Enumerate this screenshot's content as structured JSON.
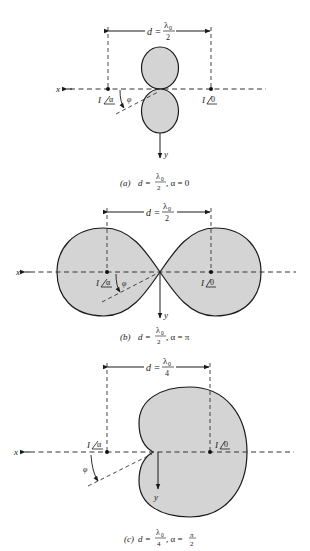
{
  "figure": {
    "colors": {
      "lobe_fill": "#d4d4d4",
      "stroke": "#1a1a1a",
      "background": "#ffffff"
    },
    "axis_labels": {
      "x": "x",
      "y": "y",
      "angle": "φ"
    },
    "panels": [
      {
        "id": "a",
        "dimension": {
          "prefix": "d =",
          "num": "λ",
          "sub": "0",
          "den": "2"
        },
        "left_source": {
          "current": "I",
          "phase": "α"
        },
        "right_source": {
          "current": "I",
          "phase": "0"
        },
        "caption": {
          "tag": "(a)",
          "prefix": "d =",
          "num": "λ",
          "sub": "0",
          "den": "2",
          "suffix": ", α = 0"
        },
        "pattern": "two circles along y-axis (broadside)"
      },
      {
        "id": "b",
        "dimension": {
          "prefix": "d =",
          "num": "λ",
          "sub": "0",
          "den": "2"
        },
        "left_source": {
          "current": "I",
          "phase": "α"
        },
        "right_source": {
          "current": "I",
          "phase": "0"
        },
        "caption": {
          "tag": "(b)",
          "prefix": "d =",
          "num": "λ",
          "sub": "0",
          "den": "2",
          "suffix": ", α = π"
        },
        "pattern": "two lobes along x-axis (endfire)"
      },
      {
        "id": "c",
        "dimension": {
          "prefix": "d =",
          "num": "λ",
          "sub": "0",
          "den": "4"
        },
        "left_source": {
          "current": "I",
          "phase": "α"
        },
        "right_source": {
          "current": "I",
          "phase": "0"
        },
        "caption": {
          "tag": "(c)",
          "prefix": "d =",
          "num": "λ",
          "sub": "0",
          "den": "4",
          "suffix": ", α =",
          "alpha_num": "π",
          "alpha_den": "2"
        },
        "pattern": "cardioid"
      }
    ]
  }
}
